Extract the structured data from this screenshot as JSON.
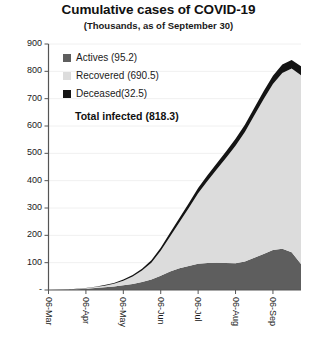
{
  "chart_data": {
    "type": "area",
    "title": "Cumulative cases of COVID-19",
    "subtitle": "(Thousands, as of September 30)",
    "xlabel": "",
    "ylabel": "",
    "stacked": true,
    "grid": true,
    "legend_position": "inside-top-left",
    "ylim": [
      0,
      900
    ],
    "yticks": [
      0,
      100,
      200,
      300,
      400,
      500,
      600,
      700,
      800,
      900
    ],
    "ytick_labels": [
      "-",
      "100",
      "200",
      "300",
      "400",
      "500",
      "600",
      "700",
      "800",
      "900"
    ],
    "x": [
      "06-Mar",
      "13-Mar",
      "20-Mar",
      "27-Mar",
      "06-Apr",
      "13-Apr",
      "20-Apr",
      "27-Apr",
      "06-May",
      "13-May",
      "20-May",
      "27-May",
      "06-Jun",
      "13-Jun",
      "20-Jun",
      "27-Jun",
      "06-Jul",
      "13-Jul",
      "20-Jul",
      "27-Jul",
      "06-Aug",
      "13-Aug",
      "20-Aug",
      "27-Aug",
      "06-Sep",
      "13-Sep",
      "20-Sep",
      "30-Sep"
    ],
    "xtick_labels": [
      "06-Mar",
      "06-Apr",
      "06-May",
      "06-Jun",
      "06-Jul",
      "06-Aug",
      "06-Sep"
    ],
    "xtick_indices": [
      0,
      4,
      8,
      12,
      16,
      20,
      24
    ],
    "series": [
      {
        "name": "Actives",
        "label": "Actives (95.2)",
        "total": 95.2,
        "color": "#5e5e5e",
        "values": [
          0.2,
          0.6,
          1.5,
          3.0,
          5.0,
          7.5,
          10.0,
          13.0,
          17.0,
          22.0,
          29.0,
          38.0,
          52.0,
          68.0,
          80.0,
          88.0,
          96.0,
          99.0,
          100.0,
          99.0,
          98.0,
          104.0,
          118.0,
          132.0,
          146.0,
          151.0,
          138.0,
          95.2
        ]
      },
      {
        "name": "Recovered",
        "label": "Recovered (690.5)",
        "total": 690.5,
        "color": "#dcdcdc",
        "values": [
          0.0,
          0.1,
          0.3,
          0.8,
          1.8,
          3.5,
          6.0,
          10.0,
          17.0,
          27.0,
          42.0,
          62.0,
          92.0,
          128.0,
          168.0,
          212.0,
          258.0,
          300.0,
          342.0,
          385.0,
          430.0,
          474.0,
          520.0,
          566.0,
          608.0,
          643.0,
          672.0,
          690.5
        ]
      },
      {
        "name": "Deceased",
        "label": "Deceased(32.5)",
        "total": 32.5,
        "color": "#141414",
        "values": [
          0.0,
          0.1,
          0.2,
          0.4,
          0.8,
          1.3,
          2.0,
          3.0,
          4.2,
          5.6,
          7.2,
          9.0,
          11.0,
          13.0,
          15.0,
          17.0,
          19.0,
          20.5,
          22.0,
          23.5,
          25.0,
          26.3,
          27.6,
          28.8,
          30.0,
          31.0,
          31.8,
          32.5
        ]
      }
    ],
    "annotations": {
      "total_label": "Total infected (818.3)",
      "total_value": 818.3
    }
  }
}
